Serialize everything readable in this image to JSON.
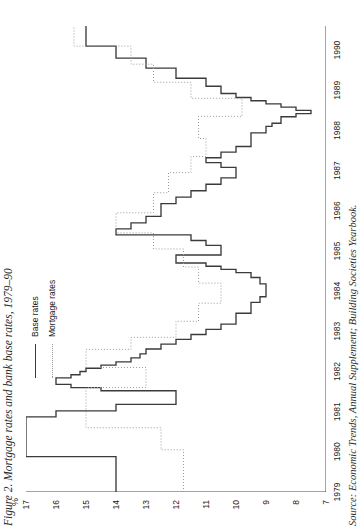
{
  "figure": {
    "title": "Figure 2. Mortgage rates and bank base rates, 1979–90",
    "source": "Source: Economic Trends, Annual Supplement; Building Societies Yearbook.",
    "axis_unit_label": "%"
  },
  "legend": {
    "position": "top-left-inside",
    "items": [
      {
        "label": "Base rates",
        "style": "solid",
        "color": "#3a3a3a"
      },
      {
        "label": "Mortgage rates",
        "style": "dotted",
        "color": "#9a9a9a"
      }
    ]
  },
  "chart_data": {
    "type": "line",
    "title": "Figure 2. Mortgage rates and bank base rates, 1979–90",
    "subtitle": "",
    "xlabel": "",
    "ylabel": "%",
    "xlim": [
      1979,
      1990.6
    ],
    "ylim": [
      7,
      17
    ],
    "grid": false,
    "orientation": "rotated-90-ccw",
    "step_type": "post",
    "legend_position": "top-left",
    "xticks": [
      1979,
      1980,
      1981,
      1982,
      1983,
      1984,
      1985,
      1986,
      1987,
      1988,
      1989,
      1990
    ],
    "xtick_labels": [
      "1979",
      "1980",
      "1981",
      "1982",
      "1983",
      "1984",
      "1985",
      "1986",
      "1987",
      "1988",
      "1989",
      "1990"
    ],
    "yticks": [
      17,
      16,
      15,
      14,
      13,
      12,
      11,
      10,
      9,
      8,
      7
    ],
    "ytick_labels": [
      "17",
      "16",
      "15",
      "14",
      "13",
      "12",
      "11",
      "10",
      "9",
      "8",
      "7"
    ],
    "series": [
      {
        "name": "Base rates",
        "style": "solid",
        "color": "#3a3a3a",
        "x": [
          1979.0,
          1979.45,
          1979.88,
          1980.55,
          1980.87,
          1981.02,
          1981.18,
          1981.3,
          1981.43,
          1981.52,
          1981.6,
          1981.68,
          1981.76,
          1981.84,
          1981.92,
          1982.0,
          1982.08,
          1982.16,
          1982.24,
          1982.34,
          1982.44,
          1982.56,
          1982.68,
          1982.8,
          1982.92,
          1983.05,
          1983.18,
          1983.3,
          1983.45,
          1983.6,
          1983.72,
          1983.86,
          1984.0,
          1984.18,
          1984.34,
          1984.46,
          1984.54,
          1984.62,
          1984.7,
          1984.8,
          1984.9,
          1985.02,
          1985.14,
          1985.26,
          1985.4,
          1985.55,
          1985.7,
          1985.86,
          1986.02,
          1986.18,
          1986.34,
          1986.5,
          1986.66,
          1986.82,
          1986.96,
          1987.08,
          1987.2,
          1987.32,
          1987.46,
          1987.6,
          1987.74,
          1987.86,
          1987.94,
          1988.02,
          1988.1,
          1988.18,
          1988.26,
          1988.34,
          1988.42,
          1988.5,
          1988.58,
          1988.66,
          1988.74,
          1988.82,
          1988.92,
          1989.1,
          1989.3,
          1989.55,
          1989.8,
          1990.1,
          1990.6
        ],
        "y": [
          14.0,
          14.0,
          17.0,
          17.0,
          16.0,
          14.0,
          12.0,
          12.0,
          12.0,
          14.5,
          15.5,
          16.0,
          16.0,
          15.5,
          15.2,
          15.0,
          14.5,
          14.0,
          13.5,
          13.2,
          13.0,
          12.5,
          12.0,
          11.5,
          11.0,
          10.5,
          10.0,
          10.0,
          9.5,
          9.5,
          9.2,
          9.0,
          9.0,
          9.2,
          9.5,
          10.0,
          10.5,
          11.0,
          12.0,
          12.0,
          10.5,
          10.5,
          11.0,
          11.5,
          14.0,
          13.5,
          13.0,
          12.5,
          12.5,
          12.0,
          11.5,
          11.0,
          10.5,
          10.0,
          10.0,
          10.5,
          11.0,
          10.5,
          10.0,
          9.5,
          9.5,
          9.5,
          9.0,
          9.0,
          8.8,
          8.5,
          8.5,
          8.0,
          7.5,
          8.0,
          8.5,
          9.0,
          9.5,
          10.0,
          10.5,
          11.0,
          12.0,
          13.0,
          14.0,
          15.0,
          15.0
        ]
      },
      {
        "name": "Mortgage rates",
        "style": "dotted",
        "color": "#9a9a9a",
        "x": [
          1979.0,
          1979.6,
          1980.05,
          1980.6,
          1981.1,
          1981.6,
          1982.1,
          1982.55,
          1982.85,
          1983.25,
          1983.7,
          1984.2,
          1984.6,
          1985.05,
          1985.45,
          1985.95,
          1986.45,
          1986.95,
          1987.35,
          1987.8,
          1988.35,
          1988.8,
          1989.2,
          1989.65,
          1990.1,
          1990.6
        ],
        "y": [
          11.75,
          11.75,
          12.5,
          15.0,
          15.0,
          13.0,
          15.0,
          13.5,
          12.0,
          11.25,
          10.5,
          11.25,
          11.75,
          12.75,
          14.0,
          12.75,
          12.25,
          11.5,
          11.0,
          11.25,
          9.8,
          11.5,
          12.75,
          13.5,
          15.4,
          15.4
        ]
      }
    ]
  }
}
